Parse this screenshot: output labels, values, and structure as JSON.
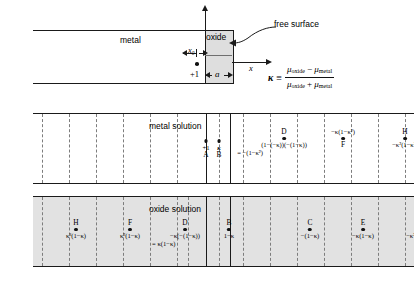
{
  "figure": {
    "top_panel": {
      "metal_label": "metal",
      "oxide_label": "oxide",
      "free_surface_label": "free surface",
      "x_axis_label": "x",
      "x0_label": "x₀",
      "a_label": "a",
      "charge_label": "+1"
    },
    "kappa_definition": {
      "symbol": "κ",
      "relation": "≡",
      "numerator": "μ_oxide − μ_metal",
      "denominator": "μ_oxide + μ_metal",
      "mu": "μ",
      "sub_oxide": "oxide",
      "sub_metal": "metal",
      "minus": "−",
      "plus": "+"
    },
    "metal_solution": {
      "title": "metal solution",
      "sites": [
        {
          "name": "A",
          "value": "+1",
          "label_above": "",
          "value_above": false,
          "x": 206,
          "name_below": true
        },
        {
          "name": "B",
          "value": "κ",
          "x": 219,
          "name_below": true
        },
        {
          "name": "D",
          "value": "(1−(−κ))(−(1−κ))",
          "value2": "= −(1−κ²)",
          "x": 251,
          "name_above": true
        },
        {
          "name": "F",
          "value": "−κ(1−κ²)",
          "x": 310,
          "name_middle": true
        },
        {
          "name": "H",
          "value": "−κ²(1−κ²)",
          "x": 372,
          "name_above": true
        }
      ]
    },
    "oxide_solution": {
      "title": "oxide solution",
      "sites": [
        {
          "name": "H",
          "value": "κ³(1−κ)",
          "x": 43
        },
        {
          "name": "F",
          "value": "κ²(1−κ)",
          "x": 97
        },
        {
          "name": "D",
          "value": "−κ(−(1−κ))",
          "value2": "= κ(1−κ)",
          "x": 152
        },
        {
          "name": "B",
          "value": "1−κ",
          "x": 196
        },
        {
          "name": "C",
          "value": "−(1−κ)",
          "x": 277
        },
        {
          "name": "E",
          "value": "−κ(1−κ)",
          "x": 330
        },
        {
          "name": "G",
          "value": "−κ²(1−κ)",
          "x": 385
        }
      ]
    },
    "caption": ""
  },
  "colors": {
    "ink": "#1a1a1a",
    "dash": "#7d7d7d",
    "oxide_fill": "#dedede",
    "oxide_solution_fill": "#e2e2e2",
    "background": "#ffffff"
  }
}
